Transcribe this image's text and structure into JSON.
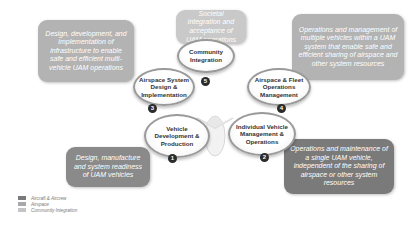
{
  "diagram": {
    "nodes": [
      {
        "id": 1,
        "label": "Vehicle Development & Production",
        "number": "1"
      },
      {
        "id": 2,
        "label": "Individual Vehicle Management & Operations",
        "number": "2"
      },
      {
        "id": 3,
        "label": "Airspace System Design & Implementation",
        "number": "3"
      },
      {
        "id": 4,
        "label": "Airspace & Fleet Operations Management",
        "number": "4"
      },
      {
        "id": 5,
        "label": "Community Integration",
        "number": "5"
      }
    ],
    "descriptions": {
      "top_left": "Design, development, and implementation of infrastructure to enable safe and efficient multi-vehicle UAM operations",
      "top_center": "Societal integration and acceptance of UAM operations",
      "top_right": "Operations and management of multiple vehicles within a UAM system that enable safe and efficient sharing of airspace and other system resources",
      "bottom_left": "Design, manufacture and system readiness of UAM vehicles",
      "bottom_right": "Operations and maintenance of a single UAM vehicle, independent of the sharing of airspace or other system resources"
    },
    "legend": [
      {
        "label": "Aircraft & Aircrew",
        "color": "#7a7a7a"
      },
      {
        "label": "Airspace",
        "color": "#a8a8a8"
      },
      {
        "label": "Community Integration",
        "color": "#c4c4c4"
      }
    ]
  }
}
